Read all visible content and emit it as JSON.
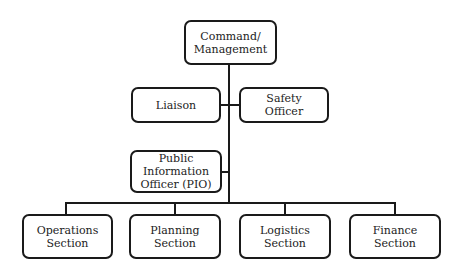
{
  "diagram": {
    "type": "org-chart",
    "nodes": [
      {
        "id": "command",
        "label": "Command/\nManagement",
        "level": 0
      },
      {
        "id": "liaison",
        "label": "Liaison",
        "level": 1,
        "parent": "command"
      },
      {
        "id": "safety",
        "label": "Safety\nOfficer",
        "level": 1,
        "parent": "command"
      },
      {
        "id": "pio",
        "label": "Public\nInformation\nOfficer (PIO)",
        "level": 1,
        "parent": "command"
      },
      {
        "id": "operations",
        "label": "Operations\nSection",
        "level": 2,
        "parent": "command"
      },
      {
        "id": "planning",
        "label": "Planning\nSection",
        "level": 2,
        "parent": "command"
      },
      {
        "id": "logistics",
        "label": "Logistics\nSection",
        "level": 2,
        "parent": "command"
      },
      {
        "id": "finance",
        "label": "Finance\nSection",
        "level": 2,
        "parent": "command"
      }
    ],
    "colors": {
      "stroke": "#1a1a1a",
      "text": "#222222",
      "background": "#ffffff"
    }
  }
}
